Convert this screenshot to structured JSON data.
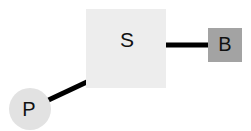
{
  "diagram": {
    "background_color": "#ffffff",
    "width": 251,
    "height": 131,
    "nodes": [
      {
        "id": "s",
        "label": "S",
        "shape": "square",
        "fill_color": "#ededed",
        "text_color": "#111111"
      },
      {
        "id": "b",
        "label": "B",
        "shape": "square",
        "fill_color": "#a3a3a3",
        "text_color": "#111111"
      },
      {
        "id": "p",
        "label": "P",
        "shape": "circle",
        "fill_color": "#e2e2e2",
        "text_color": "#111111"
      }
    ],
    "edges": [
      {
        "id": "s-to-b",
        "from": "s",
        "to": "b",
        "orientation": "horizontal",
        "color": "#000000"
      },
      {
        "id": "p-to-s",
        "from": "p",
        "to": "s",
        "orientation": "diagonal",
        "color": "#000000"
      }
    ]
  }
}
